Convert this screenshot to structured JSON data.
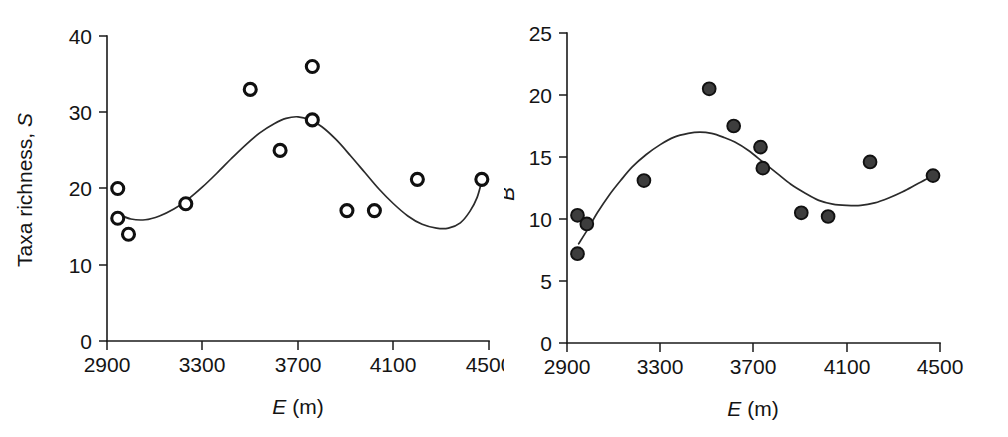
{
  "figure": {
    "background": "#ffffff",
    "panel_count": 2
  },
  "chart_data": [
    {
      "type": "scatter",
      "panel": "left",
      "title": "",
      "xlabel": "E (m)",
      "xlabel_italic_part": "E",
      "xlabel_plain_part": "(m)",
      "ylabel": "Taxa richness, S",
      "ylabel_plain_part": "Taxa richness,",
      "ylabel_italic_part": "S",
      "xlim": [
        2900,
        4500
      ],
      "ylim": [
        0,
        40
      ],
      "xticks": [
        2900,
        3300,
        3700,
        4100,
        4500
      ],
      "xticklabels": [
        "2900",
        "3300",
        "3700",
        "4100",
        "4500"
      ],
      "yticks": [
        0,
        10,
        20,
        30,
        40
      ],
      "yticklabels": [
        "0",
        "10",
        "20",
        "30",
        "40"
      ],
      "grid": false,
      "legend": false,
      "marker_style": "open-circle",
      "marker_fill": "#ffffff",
      "marker_edge": "#101010",
      "points": [
        {
          "x": 2945,
          "y": 20.0
        },
        {
          "x": 2945,
          "y": 16.1
        },
        {
          "x": 2990,
          "y": 14.0
        },
        {
          "x": 3230,
          "y": 18.0
        },
        {
          "x": 3500,
          "y": 33.0
        },
        {
          "x": 3625,
          "y": 25.0
        },
        {
          "x": 3760,
          "y": 36.0
        },
        {
          "x": 3760,
          "y": 29.0
        },
        {
          "x": 3905,
          "y": 17.1
        },
        {
          "x": 4020,
          "y": 17.1
        },
        {
          "x": 4200,
          "y": 21.2
        },
        {
          "x": 4470,
          "y": 21.2
        }
      ],
      "fit_curve": {
        "description": "smoothed polynomial fit",
        "color": "#2b2b2b",
        "points": [
          {
            "x": 2950,
            "y": 16.6
          },
          {
            "x": 3000,
            "y": 16.0
          },
          {
            "x": 3060,
            "y": 15.9
          },
          {
            "x": 3120,
            "y": 16.4
          },
          {
            "x": 3180,
            "y": 17.3
          },
          {
            "x": 3240,
            "y": 18.6
          },
          {
            "x": 3300,
            "y": 20.2
          },
          {
            "x": 3360,
            "y": 22.0
          },
          {
            "x": 3420,
            "y": 23.9
          },
          {
            "x": 3480,
            "y": 25.7
          },
          {
            "x": 3540,
            "y": 27.3
          },
          {
            "x": 3600,
            "y": 28.5
          },
          {
            "x": 3650,
            "y": 29.2
          },
          {
            "x": 3700,
            "y": 29.4
          },
          {
            "x": 3750,
            "y": 29.0
          },
          {
            "x": 3800,
            "y": 28.1
          },
          {
            "x": 3860,
            "y": 26.4
          },
          {
            "x": 3920,
            "y": 24.3
          },
          {
            "x": 3980,
            "y": 22.1
          },
          {
            "x": 4040,
            "y": 19.9
          },
          {
            "x": 4100,
            "y": 18.0
          },
          {
            "x": 4160,
            "y": 16.4
          },
          {
            "x": 4220,
            "y": 15.3
          },
          {
            "x": 4280,
            "y": 14.8
          },
          {
            "x": 4330,
            "y": 14.8
          },
          {
            "x": 4380,
            "y": 15.5
          },
          {
            "x": 4420,
            "y": 17.0
          },
          {
            "x": 4450,
            "y": 18.8
          },
          {
            "x": 4470,
            "y": 21.0
          }
        ]
      }
    },
    {
      "type": "scatter",
      "panel": "right",
      "title": "",
      "xlabel": "E (m)",
      "xlabel_italic_part": "E",
      "xlabel_plain_part": "(m)",
      "ylabel": "B",
      "ylabel_italic_part": "B",
      "xlim": [
        2900,
        4500
      ],
      "ylim": [
        0,
        25
      ],
      "xticks": [
        2900,
        3300,
        3700,
        4100,
        4500
      ],
      "xticklabels": [
        "2900",
        "3300",
        "3700",
        "4100",
        "4500"
      ],
      "yticks": [
        0,
        5,
        10,
        15,
        20,
        25
      ],
      "yticklabels": [
        "0",
        "5",
        "10",
        "15",
        "20",
        "25"
      ],
      "grid": false,
      "legend": false,
      "marker_style": "filled-circle",
      "marker_fill": "#3d3d3d",
      "marker_edge": "#111111",
      "points": [
        {
          "x": 2945,
          "y": 10.3
        },
        {
          "x": 2985,
          "y": 9.6
        },
        {
          "x": 2945,
          "y": 7.2
        },
        {
          "x": 3230,
          "y": 13.1
        },
        {
          "x": 3510,
          "y": 20.5
        },
        {
          "x": 3615,
          "y": 17.5
        },
        {
          "x": 3730,
          "y": 15.8
        },
        {
          "x": 3740,
          "y": 14.1
        },
        {
          "x": 3905,
          "y": 10.5
        },
        {
          "x": 4020,
          "y": 10.2
        },
        {
          "x": 4200,
          "y": 14.6
        },
        {
          "x": 4470,
          "y": 13.5
        }
      ],
      "fit_curve": {
        "description": "smoothed polynomial fit",
        "color": "#2b2b2b",
        "points": [
          {
            "x": 2950,
            "y": 8.0
          },
          {
            "x": 2990,
            "y": 9.2
          },
          {
            "x": 3030,
            "y": 10.5
          },
          {
            "x": 3080,
            "y": 11.9
          },
          {
            "x": 3130,
            "y": 13.1
          },
          {
            "x": 3180,
            "y": 14.2
          },
          {
            "x": 3240,
            "y": 15.2
          },
          {
            "x": 3300,
            "y": 16.0
          },
          {
            "x": 3360,
            "y": 16.6
          },
          {
            "x": 3420,
            "y": 16.9
          },
          {
            "x": 3470,
            "y": 17.0
          },
          {
            "x": 3520,
            "y": 16.9
          },
          {
            "x": 3570,
            "y": 16.6
          },
          {
            "x": 3620,
            "y": 16.2
          },
          {
            "x": 3680,
            "y": 15.5
          },
          {
            "x": 3740,
            "y": 14.6
          },
          {
            "x": 3800,
            "y": 13.7
          },
          {
            "x": 3860,
            "y": 12.8
          },
          {
            "x": 3920,
            "y": 12.1
          },
          {
            "x": 3980,
            "y": 11.5
          },
          {
            "x": 4040,
            "y": 11.2
          },
          {
            "x": 4100,
            "y": 11.1
          },
          {
            "x": 4160,
            "y": 11.1
          },
          {
            "x": 4220,
            "y": 11.3
          },
          {
            "x": 4280,
            "y": 11.7
          },
          {
            "x": 4340,
            "y": 12.2
          },
          {
            "x": 4400,
            "y": 12.8
          },
          {
            "x": 4450,
            "y": 13.3
          },
          {
            "x": 4470,
            "y": 13.6
          }
        ]
      }
    }
  ]
}
